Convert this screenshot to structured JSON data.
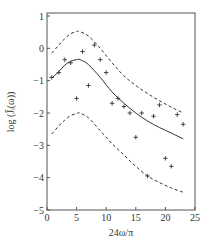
{
  "chart_data": {
    "type": "line",
    "title": "",
    "xlabel": "24ω/π",
    "ylabel": "log (Ĵᵢ(ω))",
    "xlim": [
      0,
      25
    ],
    "ylim": [
      -5,
      1
    ],
    "xticks": [
      0,
      5,
      10,
      15,
      20,
      25
    ],
    "yticks": [
      1,
      0,
      -1,
      -2,
      -3,
      -4,
      -5
    ],
    "grid": false,
    "legend": null,
    "series": [
      {
        "name": "estimate",
        "style": "solid",
        "x": [
          0.8,
          2,
          3,
          4,
          5,
          5.6,
          7,
          9,
          11,
          13,
          15,
          17,
          19,
          21,
          23
        ],
        "y": [
          -0.92,
          -0.72,
          -0.52,
          -0.4,
          -0.35,
          -0.35,
          -0.5,
          -0.9,
          -1.35,
          -1.7,
          -2.0,
          -2.25,
          -2.45,
          -2.62,
          -2.8
        ]
      },
      {
        "name": "upper bound",
        "style": "dashed",
        "x": [
          0.8,
          2,
          3,
          4,
          5,
          5.5,
          7,
          9,
          11,
          13,
          15,
          17,
          19,
          21,
          23
        ],
        "y": [
          -0.15,
          0.1,
          0.3,
          0.45,
          0.52,
          0.52,
          0.38,
          0.0,
          -0.45,
          -0.85,
          -1.15,
          -1.4,
          -1.62,
          -1.82,
          -2.0
        ]
      },
      {
        "name": "lower bound",
        "style": "dashed",
        "x": [
          0.8,
          2,
          3,
          4,
          5,
          5.5,
          7,
          9,
          11,
          13,
          15,
          17,
          19,
          21,
          23
        ],
        "y": [
          -2.65,
          -2.4,
          -2.22,
          -2.08,
          -2.02,
          -2.0,
          -2.15,
          -2.55,
          -2.95,
          -3.3,
          -3.65,
          -3.95,
          -4.15,
          -4.32,
          -4.45
        ]
      },
      {
        "name": "observations",
        "style": "markers",
        "marker": "+",
        "x": [
          0.8,
          2,
          3,
          4,
          5,
          6,
          7,
          8,
          9,
          10,
          11,
          12,
          13,
          14,
          15,
          16,
          17,
          18,
          19,
          20,
          21,
          22,
          23
        ],
        "y": [
          -0.9,
          -0.75,
          -0.35,
          -0.45,
          -1.55,
          -0.1,
          -1.15,
          0.1,
          -0.35,
          -0.75,
          -1.7,
          -1.55,
          -1.8,
          -2.0,
          -2.75,
          -2.0,
          -3.95,
          -2.1,
          -1.75,
          -3.4,
          -3.65,
          -2.05,
          -2.35
        ]
      }
    ]
  }
}
